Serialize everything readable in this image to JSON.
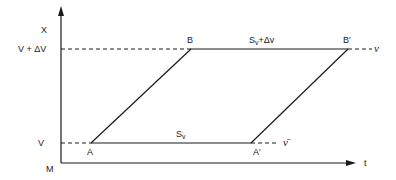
{
  "diagram": {
    "type": "parallelogram-timing-diagram",
    "axes": {
      "y_label": "X",
      "x_label": "t",
      "origin_label": "M"
    },
    "levels": {
      "upper": "V + ΔV",
      "lower": "V"
    },
    "points": {
      "A": "A",
      "B": "B",
      "A_prime": "A′",
      "B_prime": "B′"
    },
    "segments": {
      "top_label_main": "S",
      "top_label_sub": "v",
      "top_label_rest": "+Δv",
      "bottom_label_main": "S",
      "bottom_label_sub": "v"
    },
    "line_labels": {
      "upper_line": "ν",
      "lower_line": "ν̄"
    }
  }
}
